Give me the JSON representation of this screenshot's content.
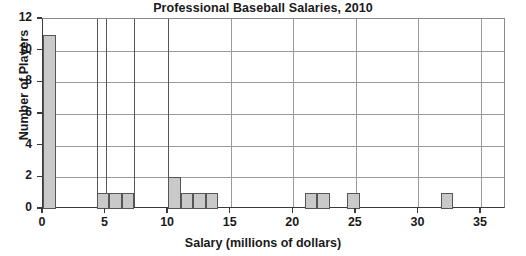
{
  "chart_data": {
    "type": "bar",
    "title": "Professional Baseball Salaries, 2010",
    "xlabel": "Salary (millions of dollars)",
    "ylabel": "Number of Players",
    "xlim": [
      0,
      37
    ],
    "ylim": [
      0,
      12
    ],
    "grid": true,
    "legend": null,
    "bar_color": "#c9c9c9",
    "bar_edge_color": "#555555",
    "xticks": [
      0,
      5,
      10,
      15,
      20,
      25,
      30,
      35
    ],
    "xtick_labels": [
      "0",
      "5",
      "10",
      "15",
      "20",
      "25",
      "30",
      "35"
    ],
    "yticks": [
      0,
      2,
      4,
      6,
      8,
      10,
      12
    ],
    "ytick_labels": [
      "0",
      "2",
      "4",
      "6",
      "8",
      "10",
      "12"
    ],
    "bins": [
      {
        "start": 0.0,
        "end": 1.0,
        "value": 11
      },
      {
        "start": 4.3,
        "end": 5.3,
        "value": 1
      },
      {
        "start": 5.3,
        "end": 6.3,
        "value": 1
      },
      {
        "start": 6.3,
        "end": 7.3,
        "value": 1
      },
      {
        "start": 10.0,
        "end": 11.0,
        "value": 2
      },
      {
        "start": 11.0,
        "end": 12.0,
        "value": 1
      },
      {
        "start": 12.0,
        "end": 13.0,
        "value": 1
      },
      {
        "start": 13.0,
        "end": 14.0,
        "value": 1
      },
      {
        "start": 20.9,
        "end": 21.9,
        "value": 1
      },
      {
        "start": 21.9,
        "end": 22.9,
        "value": 1
      },
      {
        "start": 24.3,
        "end": 25.3,
        "value": 1
      },
      {
        "start": 31.8,
        "end": 32.8,
        "value": 1
      }
    ],
    "bin_edge_lines": [
      4.3,
      5.0,
      7.3,
      10.0
    ],
    "categories": [
      "0-1",
      "4.3-5.3",
      "5.3-6.3",
      "6.3-7.3",
      "10-11",
      "11-12",
      "12-13",
      "13-14",
      "20.9-21.9",
      "21.9-22.9",
      "24.3-25.3",
      "31.8-32.8"
    ],
    "values": [
      11,
      1,
      1,
      1,
      2,
      1,
      1,
      1,
      1,
      1,
      1,
      1
    ]
  }
}
